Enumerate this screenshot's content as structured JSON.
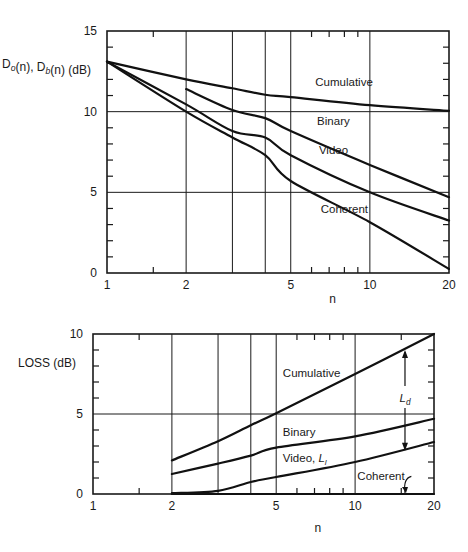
{
  "chart_data": [
    {
      "type": "line",
      "title": "",
      "xlabel": "n",
      "ylabel": "D_o(n), D_b(n) (dB)",
      "xscale": "log",
      "xlim": [
        1,
        20
      ],
      "ylim": [
        0,
        15
      ],
      "xticks": [
        1,
        2,
        5,
        10,
        20
      ],
      "xtick_labels": [
        "1",
        "2",
        "5",
        "10",
        "20"
      ],
      "yticks": [
        0,
        5,
        10,
        15
      ],
      "ytick_labels": [
        "0",
        "5",
        "10",
        "15"
      ],
      "x_gridlines": [
        2,
        3,
        4,
        5,
        10
      ],
      "y_gridlines": [
        5,
        10
      ],
      "x_minor_ticks": [
        1.5,
        6,
        7,
        8,
        9
      ],
      "y_minor_ticks": [
        1,
        2,
        3,
        4,
        6,
        7,
        8,
        9,
        11,
        12,
        13,
        14
      ],
      "grid": true,
      "legend": "inline labels",
      "series": [
        {
          "name": "Cumulative",
          "x": [
            1,
            2,
            3,
            4,
            5,
            10,
            20
          ],
          "y": [
            13.1,
            12.0,
            11.45,
            11.05,
            10.9,
            10.4,
            10.05
          ]
        },
        {
          "name": "Binary",
          "x": [
            2,
            3,
            4,
            5,
            10,
            20
          ],
          "y": [
            11.4,
            10.1,
            9.6,
            8.8,
            6.7,
            4.7
          ]
        },
        {
          "name": "Video",
          "x": [
            1,
            2,
            3,
            4,
            5,
            10,
            20
          ],
          "y": [
            13.1,
            10.45,
            8.8,
            8.4,
            7.3,
            5.0,
            3.25
          ]
        },
        {
          "name": "Coherent",
          "x": [
            1,
            2,
            3,
            4,
            5,
            10,
            20
          ],
          "y": [
            13.1,
            10.0,
            8.4,
            7.3,
            5.7,
            3.15,
            0.25
          ]
        }
      ],
      "annotations": [
        {
          "text": "Cumulative",
          "x": 6.2,
          "y": 11.6
        },
        {
          "text": "Binary",
          "x": 6.3,
          "y": 9.2
        },
        {
          "text": "Video",
          "x": 6.4,
          "y": 7.4
        },
        {
          "text": "Coherent",
          "x": 6.5,
          "y": 3.7
        }
      ]
    },
    {
      "type": "line",
      "title": "",
      "xlabel": "n",
      "ylabel": "LOSS (dB)",
      "xscale": "log",
      "xlim": [
        1,
        20
      ],
      "ylim": [
        0,
        10
      ],
      "xticks": [
        1,
        2,
        5,
        10,
        20
      ],
      "xtick_labels": [
        "1",
        "2",
        "5",
        "10",
        "20"
      ],
      "yticks": [
        0,
        5,
        10
      ],
      "ytick_labels": [
        "0",
        "5",
        "10"
      ],
      "x_gridlines": [
        2,
        3,
        4,
        5,
        10
      ],
      "y_gridlines": [
        5
      ],
      "x_minor_ticks": [
        1.5,
        6,
        7,
        8,
        9,
        15
      ],
      "y_minor_ticks": [
        1,
        2,
        3,
        4,
        6,
        7,
        8,
        9
      ],
      "grid": true,
      "legend": "inline labels",
      "series": [
        {
          "name": "Cumulative",
          "x": [
            2,
            3,
            4,
            5,
            10,
            20
          ],
          "y": [
            2.1,
            3.3,
            4.3,
            5.05,
            7.5,
            10.0
          ]
        },
        {
          "name": "Binary",
          "x": [
            2,
            3,
            4,
            5,
            10,
            20
          ],
          "y": [
            1.25,
            1.9,
            2.4,
            2.9,
            3.6,
            4.7
          ]
        },
        {
          "name": "Video, L_l",
          "x": [
            2,
            3,
            4,
            5,
            10,
            20
          ],
          "y": [
            0.05,
            0.2,
            0.75,
            1.06,
            2.0,
            3.25
          ]
        },
        {
          "name": "Coherent",
          "x": [
            2,
            20
          ],
          "y": [
            0,
            0
          ]
        }
      ],
      "annotations": [
        {
          "text": "Cumulative",
          "x": 5.3,
          "y": 7.3
        },
        {
          "text": "Binary",
          "x": 5.3,
          "y": 3.6
        },
        {
          "text": "Video, L_l",
          "x": 5.3,
          "y": 2.0
        },
        {
          "text": "Coherent",
          "x": 10.2,
          "y": 0.85,
          "arrow_to": [
            15.5,
            0
          ]
        },
        {
          "text": "L_d",
          "x": 15.5,
          "y": 6.0,
          "arrow_from_y": 9.0,
          "arrow_to_y": 2.7,
          "kind": "double-arrow"
        }
      ]
    }
  ],
  "layout": {
    "panels": [
      {
        "left": 107,
        "right": 449,
        "top": 31,
        "bottom": 273
      },
      {
        "left": 93,
        "right": 434,
        "top": 334,
        "bottom": 494
      }
    ]
  }
}
